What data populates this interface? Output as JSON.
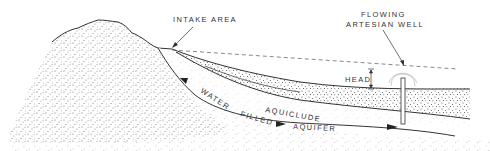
{
  "diagram": {
    "labels": {
      "intake_area": "INTAKE AREA",
      "well_line1": "FLOWING",
      "well_line2": "ARTESIAN WELL",
      "head": "HEAD",
      "aquiclude": "AQUICLUDE",
      "water": "WATER",
      "filled": "FILLED",
      "aquifer": "AQUIFER"
    },
    "colors": {
      "line": "#333333",
      "stipple": "#555555",
      "background": "#ffffff"
    }
  }
}
